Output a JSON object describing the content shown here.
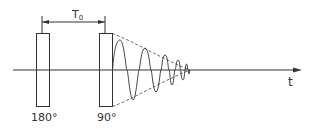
{
  "diagram": {
    "colors": {
      "stroke": "#333333",
      "background": "#ffffff"
    },
    "labels": {
      "interval": "T",
      "interval_sub": "0",
      "pulse_180": "180°",
      "pulse_90": "90°",
      "time_axis": "t"
    },
    "pulses": [
      {
        "name": "180-degree-pulse",
        "label": "180°"
      },
      {
        "name": "90-degree-pulse",
        "label": "90°"
      }
    ],
    "signal": "free induction decay (damped oscillation) with dashed exponential envelope"
  }
}
